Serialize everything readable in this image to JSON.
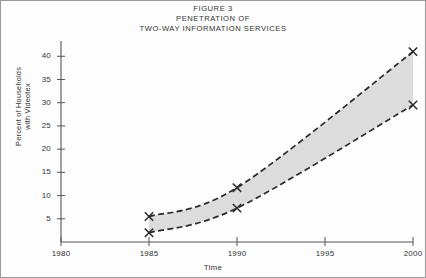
{
  "figure": {
    "title_lines": [
      "FIGURE 3",
      "PENETRATION OF",
      "TWO-WAY INFORMATION SERVICES"
    ]
  },
  "chart_data": {
    "type": "area",
    "title": "FIGURE 3 PENETRATION OF TWO-WAY INFORMATION SERVICES",
    "xlabel": "Time",
    "ylabel": "Percent of Households with Videotex",
    "ylabel_lines": [
      "Percent of Households",
      "with Videotex"
    ],
    "xlim": [
      1980,
      2000
    ],
    "ylim": [
      0,
      42
    ],
    "xticks": [
      1980,
      1985,
      1990,
      1995,
      2000
    ],
    "xtick_labels": [
      "1980",
      "1985",
      "1990",
      "1995",
      "2000"
    ],
    "yticks": [
      5,
      10,
      15,
      20,
      25,
      30,
      35,
      40
    ],
    "ytick_labels": [
      "5",
      "10",
      "15",
      "20",
      "25",
      "30",
      "35",
      "40"
    ],
    "grid": false,
    "legend": "none",
    "band_fill": "#dcdcdc",
    "line_color": "#2a2a2a",
    "line_style": "dashed",
    "marker": "x",
    "x": [
      1985,
      1990,
      2000
    ],
    "series": [
      {
        "name": "High estimate",
        "values": [
          5.5,
          11.7,
          41.0
        ]
      },
      {
        "name": "Low estimate",
        "values": [
          2.0,
          7.3,
          29.5
        ]
      }
    ]
  }
}
